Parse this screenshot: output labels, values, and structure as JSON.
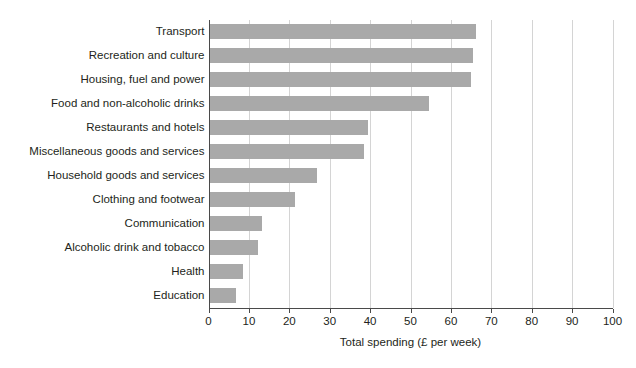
{
  "chart_data": {
    "type": "bar",
    "orientation": "horizontal",
    "title": "",
    "xlabel": "Total spending (£ per week)",
    "ylabel": "",
    "xlim": [
      0,
      100
    ],
    "xticks": [
      0,
      10,
      20,
      30,
      40,
      50,
      60,
      70,
      80,
      90,
      100
    ],
    "xtick_labels": [
      "0",
      "10",
      "20",
      "30",
      "40",
      "50",
      "60",
      "70",
      "80",
      "90",
      "100"
    ],
    "grid": "vertical",
    "legend": "none",
    "bar_color": "#a9a9a9",
    "categories": [
      "Transport",
      "Recreation and culture",
      "Housing, fuel and power",
      "Food and non-alcoholic drinks",
      "Restaurants and hotels",
      "Miscellaneous goods and services",
      "Household goods and services",
      "Clothing and footwear",
      "Communication",
      "Alcoholic drink and tobacco",
      "Health",
      "Education"
    ],
    "values": [
      66.3,
      65.4,
      65.0,
      54.5,
      39.5,
      38.5,
      26.8,
      21.5,
      13.2,
      12.2,
      8.5,
      6.9
    ]
  }
}
